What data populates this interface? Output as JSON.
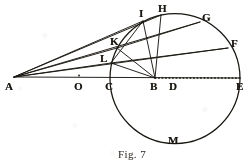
{
  "figure": {
    "caption": "Fig. 7",
    "stroke_color": "#1a1712",
    "background_color": "#ffffff",
    "points": [
      {
        "id": "A",
        "label": "A",
        "x": 14,
        "y": 77,
        "label_x": 5,
        "label_y": 81,
        "kind": "apex"
      },
      {
        "id": "O",
        "label": "O",
        "x": 79,
        "y": 77,
        "label_x": 74,
        "label_y": 81,
        "kind": "axis-mark"
      },
      {
        "id": "C",
        "label": "C",
        "x": 110,
        "y": 78,
        "label_x": 105,
        "label_y": 81,
        "kind": "circle-left"
      },
      {
        "id": "B",
        "label": "B",
        "x": 155,
        "y": 78,
        "label_x": 150,
        "label_y": 81,
        "kind": "focus"
      },
      {
        "id": "D",
        "label": "D",
        "x": 174,
        "y": 78,
        "label_x": 169,
        "label_y": 81,
        "kind": "center"
      },
      {
        "id": "E",
        "label": "E",
        "x": 240,
        "y": 78,
        "label_x": 236,
        "label_y": 81,
        "kind": "circle-right"
      },
      {
        "id": "F",
        "label": "F",
        "x": 228,
        "y": 48,
        "label_x": 231,
        "label_y": 38,
        "kind": "arc"
      },
      {
        "id": "G",
        "label": "G",
        "x": 200,
        "y": 22,
        "label_x": 202,
        "label_y": 12,
        "kind": "arc"
      },
      {
        "id": "H",
        "label": "H",
        "x": 161,
        "y": 15,
        "label_x": 158,
        "label_y": 3,
        "kind": "arc"
      },
      {
        "id": "I",
        "label": "I",
        "x": 143,
        "y": 21,
        "label_x": 139,
        "label_y": 8,
        "kind": "arc"
      },
      {
        "id": "K",
        "label": "K",
        "x": 117,
        "y": 48,
        "label_x": 110,
        "label_y": 36,
        "kind": "arc"
      },
      {
        "id": "L",
        "label": "L",
        "x": 111,
        "y": 63,
        "label_x": 100,
        "label_y": 53,
        "kind": "arc"
      },
      {
        "id": "M",
        "label": "M",
        "x": 175,
        "y": 143,
        "label_x": 168,
        "label_y": 135,
        "kind": "arc-bottom"
      }
    ],
    "circle": {
      "cx": 175,
      "cy": 78.5,
      "r": 65
    },
    "segments": [
      {
        "from": "A",
        "to": "E",
        "style": "solid",
        "name": "axis-A-to-B"
      },
      {
        "from": "B",
        "to": "E",
        "style": "dotted",
        "name": "axis-B-to-E-dotted"
      },
      {
        "from": "A",
        "to": "G",
        "style": "solid",
        "name": "ray-A-G"
      },
      {
        "from": "A",
        "to": "F",
        "style": "solid",
        "name": "ray-A-F"
      },
      {
        "from": "A",
        "to": "I",
        "style": "solid",
        "name": "ray-A-I"
      },
      {
        "from": "A",
        "to": "K",
        "style": "solid",
        "name": "ray-A-K"
      },
      {
        "from": "A",
        "to": "L",
        "style": "solid",
        "name": "ray-A-L"
      },
      {
        "from": "B",
        "to": "H",
        "style": "solid",
        "name": "chord-B-H"
      },
      {
        "from": "B",
        "to": "I",
        "style": "solid",
        "name": "chord-B-I"
      },
      {
        "from": "B",
        "to": "K",
        "style": "solid",
        "name": "chord-B-K"
      },
      {
        "from": "B",
        "to": "L",
        "style": "solid",
        "name": "chord-B-L"
      },
      {
        "from": "I",
        "to": "L",
        "style": "solid",
        "name": "chord-I-L"
      },
      {
        "from": "K",
        "to": "G",
        "style": "solid",
        "name": "chord-K-G"
      },
      {
        "from": "L",
        "to": "F",
        "style": "solid",
        "name": "chord-L-F"
      },
      {
        "from": "H",
        "to": "A",
        "style": "solid",
        "name": "ray-H-A-upper"
      }
    ]
  }
}
